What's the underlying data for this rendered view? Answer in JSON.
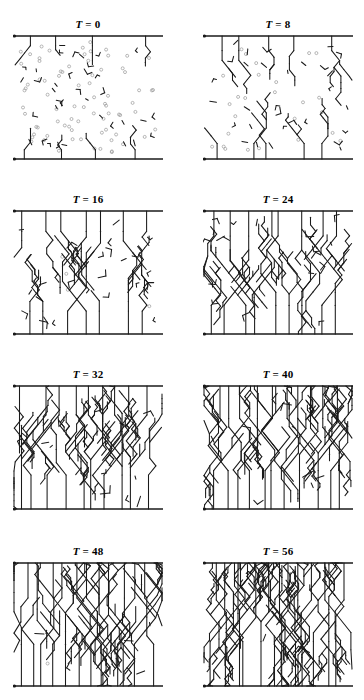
{
  "figure": {
    "type": "multi-panel-simulation-grid",
    "rows": 4,
    "cols": 2,
    "panel_width": 150,
    "panel_height": 132,
    "line_color": "#1a1a1a",
    "seed_color": "#9a9a9a",
    "background": "#ffffff"
  },
  "panels": [
    {
      "id": "panel-t0",
      "label_var": "T",
      "label_eq": " = 0",
      "title": "T = 0",
      "time": 0,
      "row": 0,
      "col": 0,
      "has_seeds": true,
      "seed_count": 78,
      "branch_density": 0.06,
      "max_depth": 1,
      "growth": 0.05,
      "rng_seed": 101
    },
    {
      "id": "panel-t8",
      "label_var": "T",
      "label_eq": " = 8",
      "title": "T = 8",
      "time": 8,
      "row": 0,
      "col": 1,
      "has_seeds": true,
      "seed_count": 26,
      "branch_density": 0.22,
      "max_depth": 2,
      "growth": 0.22,
      "rng_seed": 202
    },
    {
      "id": "panel-t16",
      "label_var": "T",
      "label_eq": " = 16",
      "title": "T = 16",
      "time": 16,
      "row": 1,
      "col": 0,
      "has_seeds": true,
      "seed_count": 4,
      "branch_density": 0.4,
      "max_depth": 3,
      "growth": 0.42,
      "rng_seed": 303
    },
    {
      "id": "panel-t24",
      "label_var": "T",
      "label_eq": " = 24",
      "title": "T = 24",
      "time": 24,
      "row": 1,
      "col": 1,
      "has_seeds": false,
      "seed_count": 0,
      "branch_density": 0.55,
      "max_depth": 3,
      "growth": 0.58,
      "rng_seed": 404
    },
    {
      "id": "panel-t32",
      "label_var": "T",
      "label_eq": " = 32",
      "title": "T = 32",
      "time": 32,
      "row": 2,
      "col": 0,
      "has_seeds": false,
      "seed_count": 0,
      "branch_density": 0.68,
      "max_depth": 4,
      "growth": 0.72,
      "rng_seed": 505
    },
    {
      "id": "panel-t40",
      "label_var": "T",
      "label_eq": " = 40",
      "title": "T = 40",
      "time": 40,
      "row": 2,
      "col": 1,
      "has_seeds": false,
      "seed_count": 0,
      "branch_density": 0.78,
      "max_depth": 4,
      "growth": 0.84,
      "rng_seed": 606
    },
    {
      "id": "panel-t48",
      "label_var": "T",
      "label_eq": " = 48",
      "title": "T = 48",
      "time": 48,
      "row": 3,
      "col": 0,
      "has_seeds": true,
      "seed_count": 1,
      "branch_density": 0.86,
      "max_depth": 4,
      "growth": 0.93,
      "rng_seed": 707
    },
    {
      "id": "panel-t56",
      "label_var": "T",
      "label_eq": " = 56",
      "title": "T = 56",
      "time": 56,
      "row": 3,
      "col": 1,
      "has_seeds": false,
      "seed_count": 0,
      "branch_density": 0.92,
      "max_depth": 5,
      "growth": 1.0,
      "rng_seed": 808
    }
  ],
  "chart_data": {
    "type": "scatter",
    "xlabel": "",
    "ylabel": "",
    "categories": [
      "T = 0",
      "T = 8",
      "T = 16",
      "T = 24",
      "T = 32",
      "T = 40",
      "T = 48",
      "T = 56"
    ],
    "series": [
      {
        "name": "time step T",
        "values": [
          0,
          8,
          16,
          24,
          32,
          40,
          48,
          56
        ]
      },
      {
        "name": "free nuclei remaining",
        "values": [
          78,
          26,
          4,
          0,
          0,
          0,
          0,
          0
        ]
      },
      {
        "name": "branch coverage fraction",
        "values": [
          0.05,
          0.22,
          0.42,
          0.58,
          0.72,
          0.84,
          0.93,
          1.0
        ]
      }
    ],
    "grid": false,
    "legend_position": "none"
  }
}
